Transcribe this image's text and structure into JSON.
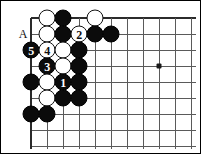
{
  "figure": {
    "kind": "go-board-diagram",
    "width": 201,
    "height": 154,
    "background": "#ffffff",
    "frame_color": "#000000"
  },
  "board": {
    "origin_x": 30,
    "origin_y": 17,
    "spacing": 16,
    "cols": 11,
    "rows": 9,
    "line_color": "#5a5a5a",
    "edge_color": "#2b2b2b",
    "stone_radius": 8.5,
    "black_color": "#0b0b0b",
    "white_color": "#ffffff"
  },
  "star_points": [
    {
      "name": "hoshi",
      "col": 8,
      "row": 3
    }
  ],
  "labels": [
    {
      "name": "point-label-a",
      "text": "A",
      "col": -0.5,
      "row": 1
    }
  ],
  "stones": [
    {
      "color": "black",
      "col": 2,
      "row": 0,
      "label": ""
    },
    {
      "color": "white",
      "col": 1,
      "row": 0,
      "label": ""
    },
    {
      "color": "white",
      "col": 4,
      "row": 0,
      "label": ""
    },
    {
      "color": "white",
      "col": 1,
      "row": 1,
      "label": ""
    },
    {
      "color": "black",
      "col": 2,
      "row": 1,
      "label": ""
    },
    {
      "color": "white",
      "col": 3,
      "row": 1,
      "label": "2"
    },
    {
      "color": "black",
      "col": 4,
      "row": 1,
      "label": ""
    },
    {
      "color": "black",
      "col": 5,
      "row": 1,
      "label": ""
    },
    {
      "color": "black",
      "col": 0,
      "row": 2,
      "label": "5"
    },
    {
      "color": "white",
      "col": 1,
      "row": 2,
      "label": "4"
    },
    {
      "color": "white",
      "col": 2,
      "row": 2,
      "label": ""
    },
    {
      "color": "black",
      "col": 3,
      "row": 2,
      "label": ""
    },
    {
      "color": "black",
      "col": 1,
      "row": 3,
      "label": "3"
    },
    {
      "color": "white",
      "col": 2,
      "row": 3,
      "label": ""
    },
    {
      "color": "black",
      "col": 3,
      "row": 3,
      "label": ""
    },
    {
      "color": "black",
      "col": 0,
      "row": 4,
      "label": ""
    },
    {
      "color": "white",
      "col": 1,
      "row": 4,
      "label": ""
    },
    {
      "color": "black",
      "col": 2,
      "row": 4,
      "label": "1"
    },
    {
      "color": "black",
      "col": 3,
      "row": 4,
      "label": ""
    },
    {
      "color": "white",
      "col": 1,
      "row": 5,
      "label": ""
    },
    {
      "color": "black",
      "col": 2,
      "row": 5,
      "label": ""
    },
    {
      "color": "black",
      "col": 3,
      "row": 5,
      "label": ""
    },
    {
      "color": "black",
      "col": 0,
      "row": 6,
      "label": ""
    },
    {
      "color": "black",
      "col": 1,
      "row": 6,
      "label": ""
    }
  ],
  "move_sequence": [
    {
      "number": "1",
      "color": "black"
    },
    {
      "number": "2",
      "color": "white"
    },
    {
      "number": "3",
      "color": "black"
    },
    {
      "number": "4",
      "color": "white"
    },
    {
      "number": "5",
      "color": "black"
    }
  ]
}
